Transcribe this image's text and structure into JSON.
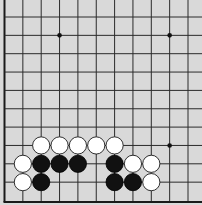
{
  "board": {
    "background": "#d9d9d9",
    "line_color": "#2a2a2a",
    "visible_columns": 11,
    "visible_rows": 11,
    "edges_shown": [
      "left",
      "bottom"
    ],
    "star_points": [
      {
        "col": 3,
        "row": 1
      },
      {
        "col": 9,
        "row": 1
      },
      {
        "col": 9,
        "row": 7
      }
    ],
    "stones": [
      {
        "color": "white",
        "col": 2,
        "row": 7
      },
      {
        "color": "white",
        "col": 3,
        "row": 7
      },
      {
        "color": "white",
        "col": 4,
        "row": 7
      },
      {
        "color": "white",
        "col": 5,
        "row": 7
      },
      {
        "color": "white",
        "col": 6,
        "row": 7
      },
      {
        "color": "white",
        "col": 1,
        "row": 8
      },
      {
        "color": "black",
        "col": 2,
        "row": 8
      },
      {
        "color": "black",
        "col": 3,
        "row": 8
      },
      {
        "color": "black",
        "col": 4,
        "row": 8
      },
      {
        "color": "black",
        "col": 6,
        "row": 8
      },
      {
        "color": "white",
        "col": 7,
        "row": 8
      },
      {
        "color": "white",
        "col": 8,
        "row": 8
      },
      {
        "color": "white",
        "col": 1,
        "row": 9
      },
      {
        "color": "black",
        "col": 2,
        "row": 9
      },
      {
        "color": "black",
        "col": 6,
        "row": 9
      },
      {
        "color": "black",
        "col": 7,
        "row": 9
      },
      {
        "color": "white",
        "col": 8,
        "row": 9
      }
    ]
  }
}
